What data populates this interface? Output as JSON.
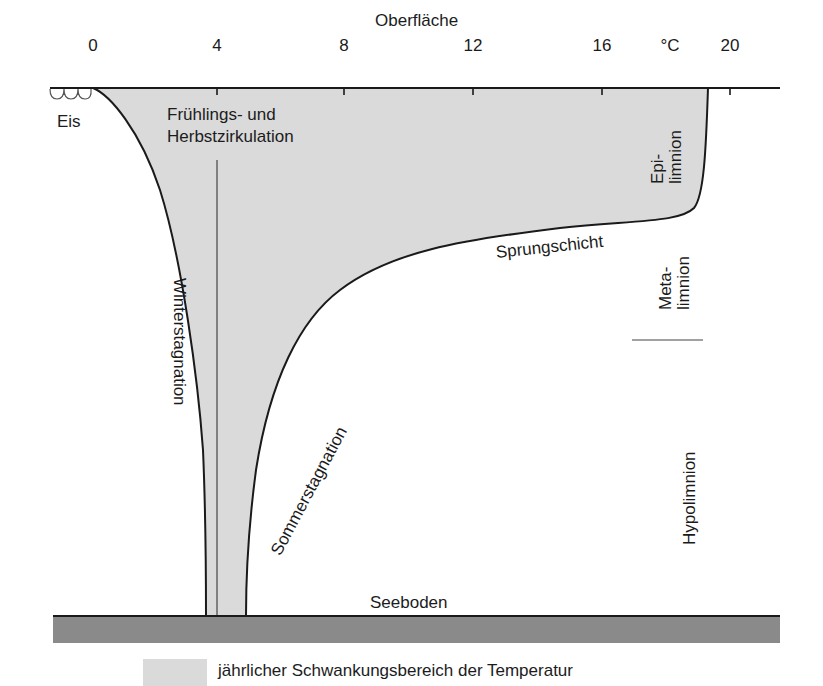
{
  "diagram": {
    "title": "Oberfläche",
    "axis": {
      "unit": "°C",
      "ticks": [
        {
          "label": "0",
          "x": 93
        },
        {
          "label": "4",
          "x": 217
        },
        {
          "label": "8",
          "x": 344
        },
        {
          "label": "12",
          "x": 473
        },
        {
          "label": "16",
          "x": 602
        },
        {
          "label": "20",
          "x": 730
        }
      ],
      "range": [
        0,
        20
      ]
    },
    "labels": {
      "ice": "Eis",
      "circulation_line1": "Frühlings- und",
      "circulation_line2": "Herbstzirkulation",
      "winter": "Winterstagnation",
      "summer": "Sommerstagnation",
      "thermocline": "Sprungschicht",
      "bottom": "Seeboden",
      "epilimnion_line1": "Epi-",
      "epilimnion_line2": "limnion",
      "metalimnion_line1": "Meta-",
      "metalimnion_line2": "limnion",
      "hypolimnion": "Hypolimnion"
    },
    "legend": {
      "text": "jährlicher Schwankungsbereich der Temperatur",
      "swatch_color": "#dadada"
    },
    "colors": {
      "fill": "#dadada",
      "line": "#1a1a1a",
      "ground": "#8a8a8a"
    },
    "curves": {
      "winter_profile": "0 °C at surface, approaching 4 °C at depth",
      "circulation_profile": "constant 4 °C",
      "summer_profile": "~18.8 °C at surface, sharp drop at thermocline, ~4.5 °C at bottom"
    }
  }
}
